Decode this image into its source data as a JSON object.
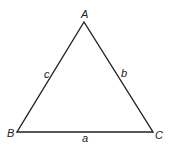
{
  "diagram": {
    "type": "triangle",
    "vertices": [
      {
        "name": "A",
        "x": 84,
        "y": 22
      },
      {
        "name": "B",
        "x": 17,
        "y": 132
      },
      {
        "name": "C",
        "x": 153,
        "y": 132
      }
    ],
    "vertex_labels": {
      "A": "A",
      "B": "B",
      "C": "C"
    },
    "side_labels": {
      "a": "a",
      "b": "b",
      "c": "c"
    },
    "stroke_color": "#222222",
    "background": "#ffffff"
  }
}
